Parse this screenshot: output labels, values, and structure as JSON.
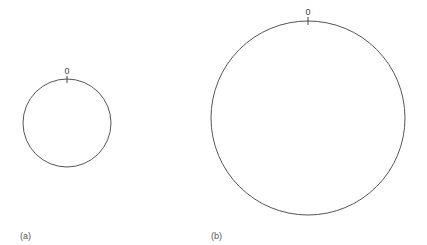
{
  "figure": {
    "panels": [
      {
        "id": "a",
        "caption": "(a)",
        "circle": {
          "cx": 67,
          "cy": 123,
          "r": 44
        },
        "tick_label": "0"
      },
      {
        "id": "b",
        "caption": "(b)",
        "circle": {
          "cx": 308,
          "cy": 118,
          "r": 97
        },
        "tick_label": "0"
      }
    ],
    "colors": {
      "stroke": "#555555",
      "text": "#555555",
      "background": "#ffffff"
    }
  }
}
